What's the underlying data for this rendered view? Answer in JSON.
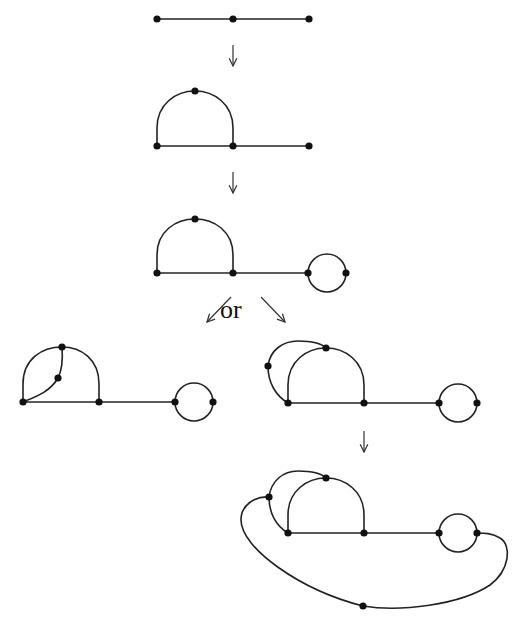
{
  "diagram": {
    "type": "graph-transformation-sequence",
    "label_or": "or",
    "colors": {
      "edge": "#222222",
      "vertex": "#111111",
      "arrow": "#333333",
      "background": "#ffffff"
    },
    "steps": [
      {
        "id": "step1",
        "description": "path with 3 vertices",
        "vertices": 3,
        "edges": 2
      },
      {
        "id": "step2",
        "description": "path with semicircular arc (4 vertices)",
        "vertices": 4,
        "edges": 4
      },
      {
        "id": "step3",
        "description": "arc graph with loop (2-vertex cycle) attached",
        "vertices": 6,
        "edges": 7
      },
      {
        "id": "step4a",
        "description": "chord added inside arc",
        "vertices": 7,
        "edges": 9
      },
      {
        "id": "step4b",
        "description": "outer arc added over arc",
        "vertices": 7,
        "edges": 9
      },
      {
        "id": "step5",
        "description": "large outer curve connecting outer vertex to loop",
        "vertices": 8,
        "edges": 11
      }
    ],
    "arrows": [
      {
        "id": "arrow1",
        "direction": "down"
      },
      {
        "id": "arrow2",
        "direction": "down"
      },
      {
        "id": "arrow3",
        "direction": "down-left"
      },
      {
        "id": "arrow4",
        "direction": "down-right"
      },
      {
        "id": "arrow5",
        "direction": "down"
      }
    ]
  }
}
